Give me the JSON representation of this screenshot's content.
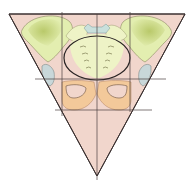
{
  "diagram": {
    "colors": {
      "background": "#ffffff",
      "triangle_fill": "#f1d6cc",
      "ilium_fill": "#e3eeb0",
      "ilium_shade": "#b9c96a",
      "sacrum_fill": "#eef3c6",
      "vertebra_fill": "#c9e0dc",
      "pubis_fill": "#f3c99a",
      "acetabulum_fill": "#c8d7d9",
      "outline": "#3a3030",
      "grid_line": "#4a3f3f"
    },
    "triangle": {
      "top_left": [
        9,
        14
      ],
      "top_right": [
        185,
        14
      ],
      "apex": [
        97,
        176
      ]
    },
    "grid": {
      "vertical_x": [
        62,
        97,
        130
      ],
      "horizontal": [
        {
          "y": 79,
          "x1": 35,
          "x2": 166
        },
        {
          "y": 110,
          "x1": 55,
          "x2": 152
        }
      ]
    }
  }
}
